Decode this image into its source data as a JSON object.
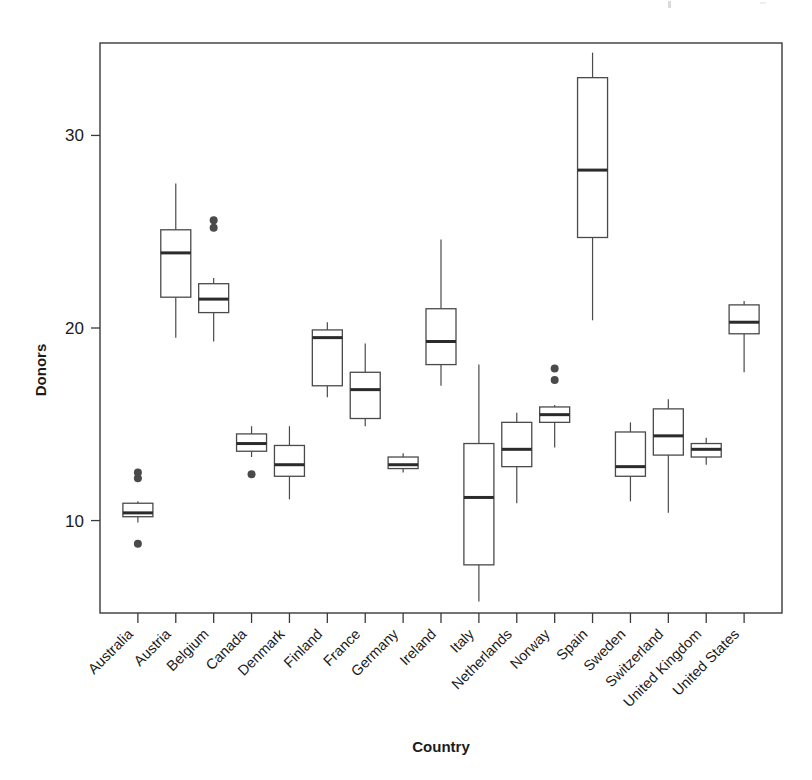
{
  "chart_data": {
    "type": "box",
    "title": "",
    "xlabel": "Country",
    "ylabel": "Donors",
    "categories": [
      "Australia",
      "Austria",
      "Belgium",
      "Canada",
      "Denmark",
      "Finland",
      "France",
      "Germany",
      "Ireland",
      "Italy",
      "Netherlands",
      "Norway",
      "Spain",
      "Sweden",
      "Switzerland",
      "United Kingdom",
      "United States"
    ],
    "y_ticks": [
      10,
      20,
      30
    ],
    "y_tick_labels": [
      "10",
      "20",
      "30"
    ],
    "ylim": [
      5.2,
      34.8
    ],
    "grid": false,
    "legend": "none",
    "boxes": [
      {
        "name": "Australia",
        "whisker_low": 9.9,
        "q1": 10.2,
        "median": 10.4,
        "q3": 10.9,
        "whisker_high": 11.0,
        "outliers": [
          12.5,
          12.2,
          8.8
        ]
      },
      {
        "name": "Austria",
        "whisker_low": 19.5,
        "q1": 21.6,
        "median": 23.9,
        "q3": 25.1,
        "whisker_high": 27.5,
        "outliers": []
      },
      {
        "name": "Belgium",
        "whisker_low": 19.3,
        "q1": 20.8,
        "median": 21.5,
        "q3": 22.3,
        "whisker_high": 22.6,
        "outliers": [
          25.6,
          25.2
        ]
      },
      {
        "name": "Canada",
        "whisker_low": 13.3,
        "q1": 13.6,
        "median": 14.0,
        "q3": 14.5,
        "whisker_high": 14.9,
        "outliers": [
          12.4
        ]
      },
      {
        "name": "Denmark",
        "whisker_low": 11.1,
        "q1": 12.3,
        "median": 12.9,
        "q3": 13.9,
        "whisker_high": 14.9,
        "outliers": []
      },
      {
        "name": "Finland",
        "whisker_low": 16.4,
        "q1": 17.0,
        "median": 19.5,
        "q3": 19.9,
        "whisker_high": 20.3,
        "outliers": []
      },
      {
        "name": "France",
        "whisker_low": 14.9,
        "q1": 15.3,
        "median": 16.8,
        "q3": 17.7,
        "whisker_high": 19.2,
        "outliers": []
      },
      {
        "name": "Germany",
        "whisker_low": 12.5,
        "q1": 12.7,
        "median": 12.9,
        "q3": 13.3,
        "whisker_high": 13.5,
        "outliers": []
      },
      {
        "name": "Ireland",
        "whisker_low": 17.0,
        "q1": 18.1,
        "median": 19.3,
        "q3": 21.0,
        "whisker_high": 24.6,
        "outliers": []
      },
      {
        "name": "Italy",
        "whisker_low": 5.8,
        "q1": 7.7,
        "median": 11.2,
        "q3": 14.0,
        "whisker_high": 18.1,
        "outliers": []
      },
      {
        "name": "Netherlands",
        "whisker_low": 10.9,
        "q1": 12.8,
        "median": 13.7,
        "q3": 15.1,
        "whisker_high": 15.6,
        "outliers": []
      },
      {
        "name": "Norway",
        "whisker_low": 13.8,
        "q1": 15.1,
        "median": 15.5,
        "q3": 15.9,
        "whisker_high": 16.0,
        "outliers": [
          17.9,
          17.3
        ]
      },
      {
        "name": "Spain",
        "whisker_low": 20.4,
        "q1": 24.7,
        "median": 28.2,
        "q3": 33.0,
        "whisker_high": 34.3,
        "outliers": []
      },
      {
        "name": "Sweden",
        "whisker_low": 11.0,
        "q1": 12.3,
        "median": 12.8,
        "q3": 14.6,
        "whisker_high": 15.1,
        "outliers": []
      },
      {
        "name": "Switzerland",
        "whisker_low": 10.4,
        "q1": 13.4,
        "median": 14.4,
        "q3": 15.8,
        "whisker_high": 16.3,
        "outliers": []
      },
      {
        "name": "United Kingdom",
        "whisker_low": 12.9,
        "q1": 13.3,
        "median": 13.7,
        "q3": 14.0,
        "whisker_high": 14.3,
        "outliers": []
      },
      {
        "name": "United States",
        "whisker_low": 17.7,
        "q1": 19.7,
        "median": 20.3,
        "q3": 21.2,
        "whisker_high": 21.4,
        "outliers": []
      }
    ]
  }
}
